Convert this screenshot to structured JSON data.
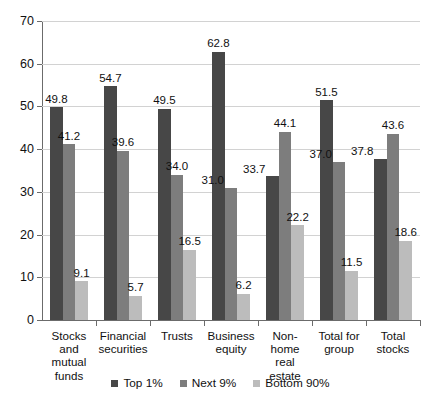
{
  "chart_data": {
    "type": "bar",
    "title": "",
    "subtitle": "",
    "xlabel": "",
    "ylabel": "",
    "ylim": [
      0,
      70
    ],
    "ytick_step": 10,
    "yticks": [
      "0",
      "10",
      "20",
      "30",
      "40",
      "50",
      "60",
      "70"
    ],
    "grid": true,
    "legend_position": "bottom",
    "categories": [
      "Stocks and mutual funds",
      "Financial securities",
      "Trusts",
      "Business equity",
      "Non-home real estate",
      "Total for group",
      "Total stocks"
    ],
    "category_lines": [
      [
        "Stocks",
        "and mutual",
        "funds"
      ],
      [
        "Financial",
        "securities"
      ],
      [
        "Trusts"
      ],
      [
        "Business",
        "equity"
      ],
      [
        "Non-home",
        "real estate"
      ],
      [
        "Total for",
        "group"
      ],
      [
        "Total",
        "stocks"
      ]
    ],
    "series": [
      {
        "name": "Top 1%",
        "color": "#474747",
        "values": [
          49.8,
          54.7,
          49.5,
          62.8,
          33.7,
          51.5,
          37.8
        ],
        "labels": [
          "49.8",
          "54.7",
          "49.5",
          "62.8",
          "33.7",
          "51.5",
          "37.8"
        ]
      },
      {
        "name": "Next 9%",
        "color": "#7d7d7d",
        "values": [
          41.2,
          39.6,
          34.0,
          31.0,
          44.1,
          37.0,
          43.6
        ],
        "labels": [
          "41.2",
          "39.6",
          "34.0",
          "31.0",
          "44.1",
          "37.0",
          "43.6"
        ]
      },
      {
        "name": "Bottom 90%",
        "color": "#bcbcbc",
        "values": [
          9.1,
          5.7,
          16.5,
          6.2,
          22.2,
          11.5,
          18.6
        ],
        "labels": [
          "9.1",
          "5.7",
          "16.5",
          "6.2",
          "22.2",
          "11.5",
          "18.6"
        ]
      }
    ]
  },
  "legend": {
    "items": [
      {
        "label": "Top 1%",
        "swatch": "dark-gray-swatch"
      },
      {
        "label": "Next 9%",
        "swatch": "medium-gray-swatch"
      },
      {
        "label": "Bottom 90%",
        "swatch": "light-gray-swatch"
      }
    ]
  }
}
